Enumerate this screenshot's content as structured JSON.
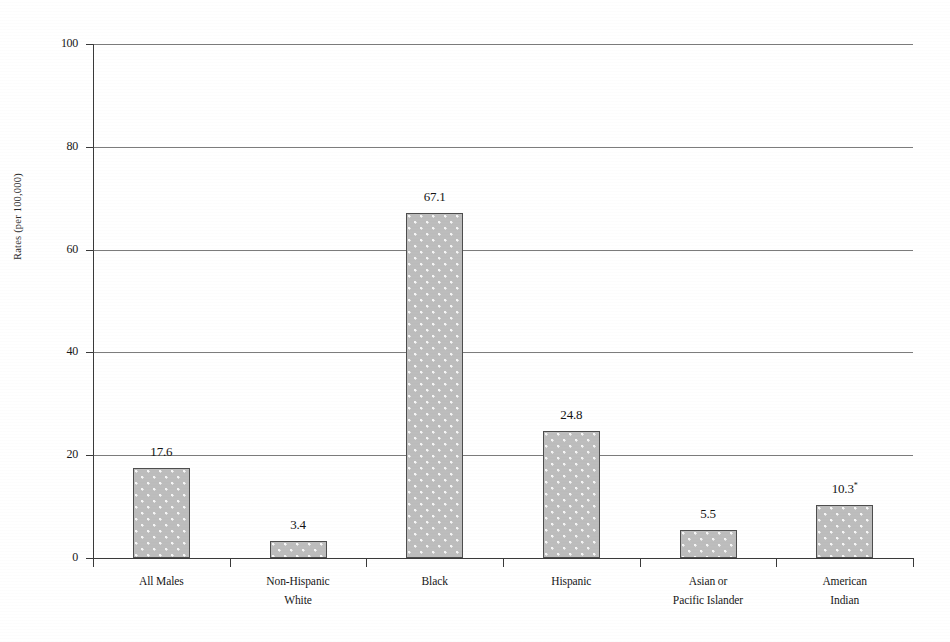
{
  "chart_data": {
    "type": "bar",
    "title": "",
    "title_note": "title cropped off at top edge of scan",
    "xlabel": "",
    "ylabel": "Rates (per 100,000)",
    "ylim": [
      0,
      100
    ],
    "ytick_labels": [
      "0",
      "20",
      "40",
      "60",
      "80",
      "100"
    ],
    "ytick_values": [
      0,
      20,
      40,
      60,
      80,
      100
    ],
    "grid": true,
    "legend": "none",
    "categories": [
      "All Males",
      "Non-Hispanic White",
      "Black",
      "Hispanic",
      "Asian or Pacific Islander",
      "American Indian"
    ],
    "category_lines": [
      [
        "All Males",
        ""
      ],
      [
        "Non-Hispanic",
        "White"
      ],
      [
        "Black",
        ""
      ],
      [
        "Hispanic",
        ""
      ],
      [
        "Asian or",
        "Pacific Islander"
      ],
      [
        "American",
        "Indian"
      ]
    ],
    "values": [
      17.6,
      3.4,
      67.1,
      24.8,
      5.5,
      10.3
    ],
    "data_labels": [
      "17.6",
      "3.4",
      "67.1",
      "24.8",
      "5.5",
      "10.3"
    ],
    "data_label_markers": [
      "",
      "",
      "",
      "",
      "",
      "*"
    ],
    "bar_fill": "#bdbdbd",
    "bar_pattern": "dotted-stipple",
    "bar_border": "#4e4e4e"
  }
}
